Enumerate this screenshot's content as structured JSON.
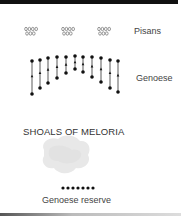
{
  "diagram": {
    "labels": {
      "pisans": "Pisans",
      "genoese": "Genoese",
      "shoals": "SHOALS OF MELORIA",
      "genoese_reserve": "Genoese reserve"
    },
    "pisan_groups": [
      {
        "x": 26,
        "top_row": "0000",
        "bottom_row": "000"
      },
      {
        "x": 63,
        "top_row": "0000",
        "bottom_row": "000"
      },
      {
        "x": 99,
        "top_row": "0000",
        "bottom_row": "000"
      }
    ],
    "genoese_columns": [
      {
        "x": 32,
        "top": 61,
        "bottom": 94
      },
      {
        "x": 40,
        "top": 60,
        "bottom": 88
      },
      {
        "x": 48,
        "top": 58,
        "bottom": 83
      },
      {
        "x": 57,
        "top": 57,
        "bottom": 78
      },
      {
        "x": 66,
        "top": 57,
        "bottom": 73
      },
      {
        "x": 75,
        "top": 56,
        "bottom": 69
      },
      {
        "x": 83,
        "top": 57,
        "bottom": 72
      },
      {
        "x": 92,
        "top": 57,
        "bottom": 77
      },
      {
        "x": 101,
        "top": 58,
        "bottom": 82
      },
      {
        "x": 110,
        "top": 60,
        "bottom": 88
      },
      {
        "x": 118,
        "top": 61,
        "bottom": 92
      }
    ],
    "reserve_dot_count": 7,
    "colors": {
      "ink": "#111111",
      "shoal": "#e6e6e6",
      "text": "#444444"
    }
  }
}
